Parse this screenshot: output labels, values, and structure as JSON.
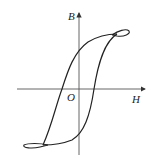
{
  "diagram": {
    "type": "hysteresis-loop",
    "axes": {
      "x_label": "H",
      "y_label": "B",
      "origin_label": "O"
    },
    "colors": {
      "stroke": "#222222",
      "axis": "#555555"
    }
  }
}
